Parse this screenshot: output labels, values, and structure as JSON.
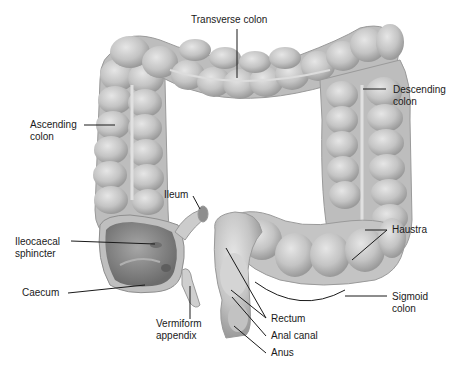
{
  "diagram": {
    "colors": {
      "background": "#ffffff",
      "tissue_light": "#d9d9d9",
      "tissue_mid": "#bdbdbd",
      "tissue_dark": "#8e8e8e",
      "caecum_interior": "#8a8a8a",
      "leader_line": "#1a1a1a",
      "label_text": "#1a1a1a"
    },
    "labels": {
      "transverse_colon": "Transverse colon",
      "descending_colon": "Descending\ncolon",
      "ascending_colon": "Ascending\ncolon",
      "ileum": "Ileum",
      "ileocaecal_sphincter": "Ileocaecal\nsphincter",
      "caecum": "Caecum",
      "vermiform_appendix": "Vermiform\nappendix",
      "haustra": "Haustra",
      "sigmoid_colon": "Sigmoid\ncolon",
      "rectum": "Rectum",
      "anal_canal": "Anal canal",
      "anus": "Anus"
    }
  }
}
